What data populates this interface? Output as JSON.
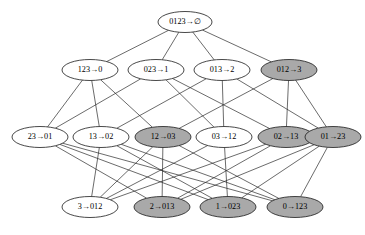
{
  "diagram": {
    "type": "hasse-diagram",
    "width": 365,
    "height": 235,
    "colors": {
      "background": "#ffffff",
      "node_fill_plain": "#ffffff",
      "node_fill_shaded": "#a9a9a9",
      "node_stroke": "#1a1a1a",
      "edge_stroke": "#2b2b2b"
    },
    "arrow_glyph": "→",
    "empty_set_glyph": "∅",
    "ranks": [
      {
        "index": 0,
        "y": 22,
        "nodes": [
          {
            "id": "n0",
            "label": "0123→∅",
            "left": "0123",
            "right": "∅",
            "cx": 185,
            "cy": 22,
            "rx": 27,
            "ry": 10.5,
            "shaded": false
          }
        ]
      },
      {
        "index": 1,
        "y": 70,
        "nodes": [
          {
            "id": "n1",
            "label": "123→0",
            "left": "123",
            "right": "0",
            "cx": 90,
            "cy": 70,
            "rx": 28,
            "ry": 10.5,
            "shaded": false
          },
          {
            "id": "n2",
            "label": "023→1",
            "left": "023",
            "right": "1",
            "cx": 156,
            "cy": 70,
            "rx": 28,
            "ry": 10.5,
            "shaded": false
          },
          {
            "id": "n3",
            "label": "013→2",
            "left": "013",
            "right": "2",
            "cx": 222,
            "cy": 70,
            "rx": 28,
            "ry": 10.5,
            "shaded": false
          },
          {
            "id": "n4",
            "label": "012→3",
            "left": "012",
            "right": "3",
            "cx": 289,
            "cy": 70,
            "rx": 28,
            "ry": 10.5,
            "shaded": true
          }
        ]
      },
      {
        "index": 2,
        "y": 137,
        "nodes": [
          {
            "id": "n5",
            "label": "23→01",
            "left": "23",
            "right": "01",
            "cx": 40,
            "cy": 137,
            "rx": 28,
            "ry": 10.5,
            "shaded": false
          },
          {
            "id": "n6",
            "label": "13→02",
            "left": "13",
            "right": "02",
            "cx": 101,
            "cy": 137,
            "rx": 28,
            "ry": 10.5,
            "shaded": false
          },
          {
            "id": "n7",
            "label": "12→03",
            "left": "12",
            "right": "03",
            "cx": 163,
            "cy": 137,
            "rx": 28,
            "ry": 10.5,
            "shaded": true
          },
          {
            "id": "n8",
            "label": "03→12",
            "left": "03",
            "right": "12",
            "cx": 224,
            "cy": 137,
            "rx": 28,
            "ry": 10.5,
            "shaded": false
          },
          {
            "id": "n9",
            "label": "02→13",
            "left": "02",
            "right": "13",
            "cx": 286,
            "cy": 137,
            "rx": 28,
            "ry": 10.5,
            "shaded": true
          },
          {
            "id": "n10",
            "label": "01→23",
            "left": "01",
            "right": "23",
            "cx": 333,
            "cy": 137,
            "rx": 28,
            "ry": 10.5,
            "shaded": true
          }
        ]
      },
      {
        "index": 3,
        "y": 207,
        "nodes": [
          {
            "id": "n11",
            "label": "3→012",
            "left": "3",
            "right": "012",
            "cx": 90,
            "cy": 207,
            "rx": 28,
            "ry": 10.5,
            "shaded": false
          },
          {
            "id": "n12",
            "label": "2→013",
            "left": "2",
            "right": "013",
            "cx": 162,
            "cy": 207,
            "rx": 28,
            "ry": 10.5,
            "shaded": true
          },
          {
            "id": "n13",
            "label": "1→023",
            "left": "1",
            "right": "023",
            "cx": 228,
            "cy": 207,
            "rx": 28,
            "ry": 10.5,
            "shaded": true
          },
          {
            "id": "n14",
            "label": "0→123",
            "left": "0",
            "right": "123",
            "cx": 295,
            "cy": 207,
            "rx": 28,
            "ry": 10.5,
            "shaded": true
          }
        ]
      }
    ],
    "edges": [
      {
        "from": "n0",
        "to": "n1"
      },
      {
        "from": "n0",
        "to": "n2"
      },
      {
        "from": "n0",
        "to": "n3"
      },
      {
        "from": "n0",
        "to": "n4"
      },
      {
        "from": "n1",
        "to": "n5"
      },
      {
        "from": "n1",
        "to": "n6"
      },
      {
        "from": "n1",
        "to": "n7"
      },
      {
        "from": "n2",
        "to": "n5"
      },
      {
        "from": "n2",
        "to": "n8"
      },
      {
        "from": "n2",
        "to": "n9"
      },
      {
        "from": "n3",
        "to": "n6"
      },
      {
        "from": "n3",
        "to": "n8"
      },
      {
        "from": "n3",
        "to": "n10"
      },
      {
        "from": "n4",
        "to": "n7"
      },
      {
        "from": "n4",
        "to": "n9"
      },
      {
        "from": "n4",
        "to": "n10"
      },
      {
        "from": "n5",
        "to": "n12"
      },
      {
        "from": "n5",
        "to": "n13"
      },
      {
        "from": "n5",
        "to": "n14"
      },
      {
        "from": "n6",
        "to": "n11"
      },
      {
        "from": "n6",
        "to": "n13"
      },
      {
        "from": "n6",
        "to": "n14"
      },
      {
        "from": "n7",
        "to": "n11"
      },
      {
        "from": "n7",
        "to": "n12"
      },
      {
        "from": "n7",
        "to": "n14"
      },
      {
        "from": "n8",
        "to": "n11"
      },
      {
        "from": "n8",
        "to": "n13"
      },
      {
        "from": "n9",
        "to": "n11"
      },
      {
        "from": "n9",
        "to": "n12"
      },
      {
        "from": "n10",
        "to": "n12"
      },
      {
        "from": "n10",
        "to": "n13"
      },
      {
        "from": "n10",
        "to": "n14"
      }
    ]
  }
}
